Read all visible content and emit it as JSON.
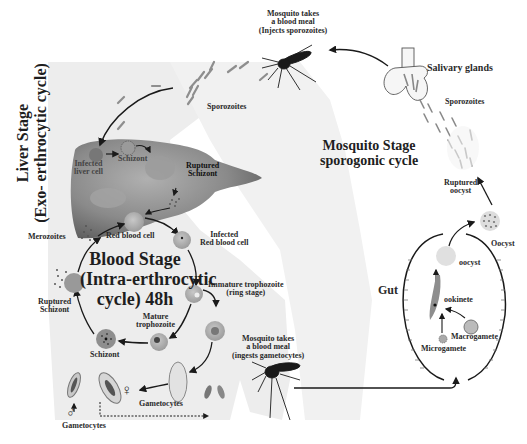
{
  "diagram": {
    "colors": {
      "background": "#ffffff",
      "body_silhouette": "#ececec",
      "liver": "#8c8c8c",
      "rbc": "#b4b4b4",
      "arrow": "#1a1a1a",
      "text": "#222222"
    },
    "stages": {
      "liver": {
        "title_line1": "Liver Stage",
        "title_line2": "(Exo- erthrocytic cycle)"
      },
      "blood": {
        "title_line1": "Blood Stage",
        "title_line2": "(Intra-erthrocytic",
        "title_line3": "cycle) 48h"
      },
      "mosquito": {
        "title_line1": "Mosquito Stage",
        "title_line2": "sporogonic cycle"
      }
    },
    "labels": {
      "mosquito_inject_1": "Mosquito takes",
      "mosquito_inject_2": "a blood meal",
      "mosquito_inject_3": "(Injects sporozoites)",
      "sporozoites_human": "Sporozoites",
      "infected_liver_1": "Infected",
      "infected_liver_2": "liver cell",
      "schizont_liver": "Schizont",
      "ruptured_schizont_liver_1": "Ruptured",
      "ruptured_schizont_liver_2": "Schizont",
      "merozoites": "Merozoites",
      "red_blood_cell": "Red blood cell",
      "infected_rbc_1": "Infected",
      "infected_rbc_2": "Red blood cell",
      "immature_troph_1": "Immature trophozoite",
      "immature_troph_2": "(ring stage)",
      "mature_troph_1": "Mature",
      "mature_troph_2": "trophozoite",
      "schizont_blood": "Schizont",
      "ruptured_schizont_blood_1": "Ruptured",
      "ruptured_schizont_blood_2": "Schizont",
      "gametocytes_mid": "Gametocytes",
      "gametocytes_left": "Gametocytes",
      "male_symbol": "♂",
      "female_symbol": "♀",
      "mosquito_ingest_1": "Mosquito takes",
      "mosquito_ingest_2": "a blood meal",
      "mosquito_ingest_3": "(ingests gametocytes)",
      "gut": "Gut",
      "oocyst_in_gut": "oocyst",
      "ookinete": "ookinete",
      "macrogamete": "Macrogamete",
      "microgamete": "Microgamete",
      "oocyst_outside": "Oocyst",
      "ruptured_oocyst_1": "Ruptured",
      "ruptured_oocyst_2": "oocyst",
      "sporozoites_mosquito": "Sporozoites",
      "salivary_glands": "Salivary glands"
    }
  }
}
